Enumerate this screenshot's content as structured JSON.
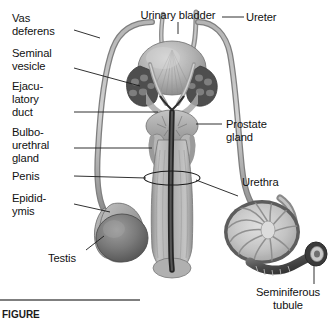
{
  "figure": {
    "caption_visible_fragment": "FIGURE",
    "background_color": "#ffffff",
    "ink_color": "#111111"
  },
  "labels": {
    "vas_deferens": "Vas\ndeferens",
    "vas_deferens_line1": "Vas",
    "vas_deferens_line2": "deferens",
    "seminal_vesicle_line1": "Seminal",
    "seminal_vesicle_line2": "vesicle",
    "ejaculatory_duct_line1": "Ejacu-",
    "ejaculatory_duct_line2": "latory",
    "ejaculatory_duct_line3": "duct",
    "bulbourethral_line1": "Bulbo-",
    "bulbourethral_line2": "urethral",
    "bulbourethral_line3": "gland",
    "penis": "Penis",
    "epididymis_line1": "Epidid-",
    "epididymis_line2": "ymis",
    "testis": "Testis",
    "urinary_bladder": "Urinary bladder",
    "ureter": "Ureter",
    "prostate_line1": "Prostate",
    "prostate_line2": "gland",
    "urethra": "Urethra",
    "seminiferous_line1": "Seminiferous",
    "seminiferous_line2": "tubule"
  },
  "colors": {
    "tube_light": "#b9b9b9",
    "tube_mid": "#9a9a9a",
    "tube_dark": "#6e6e6e",
    "organ_light": "#c9c9c9",
    "organ_mid": "#a5a5a5",
    "organ_dark": "#757575",
    "canal_dark": "#3a3a3a",
    "canal_black": "#1e1e1e",
    "outline": "#5a5a5a"
  }
}
